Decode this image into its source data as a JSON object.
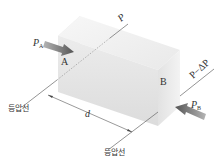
{
  "diagram": {
    "type": "pressure-drop-box",
    "labels": {
      "P": "P",
      "P_minus_dP": "P−ΔP",
      "P_A": "P",
      "P_A_sub": "A",
      "P_B": "P",
      "P_B_sub": "B",
      "point_A": "A",
      "point_B": "B",
      "distance": "d",
      "isobar_left": "등압선",
      "isobar_bottom": "등압선"
    },
    "colors": {
      "box_top": "#f2f2f2",
      "box_front": "#e6e6e6",
      "box_side": "#d9d9d9",
      "arrow": "#6f6f6f",
      "line": "#555555",
      "text": "#333333"
    }
  }
}
